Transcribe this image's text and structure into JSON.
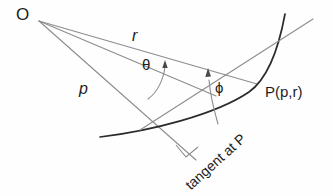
{
  "figure": {
    "type": "geometry-diagram",
    "background_color": "#fefefe",
    "stroke_color_light": "#8d8d8d",
    "stroke_color_dark": "#2b2b2b",
    "text_color": "#1d1d1d",
    "labels": {
      "origin": "O",
      "radius": "r",
      "theta": "θ",
      "pedal": "p",
      "phi": "ϕ",
      "point": "P(p,r)",
      "tangent": "tangent at P"
    },
    "elements": [
      {
        "name": "origin-point",
        "label": "O",
        "x": 38,
        "y": 20
      },
      {
        "name": "point-p",
        "label": "P(p,r)",
        "x": 256,
        "y": 84
      },
      {
        "name": "radius-line",
        "label": "r",
        "from": "O",
        "to": "P"
      },
      {
        "name": "pedal-line",
        "label": "p",
        "from": "O",
        "to": "foot of perpendicular"
      },
      {
        "name": "polar-axis-line",
        "from": "O",
        "to": "reference direction"
      },
      {
        "name": "curve",
        "label": "curve through P"
      },
      {
        "name": "tangent-line",
        "label": "tangent at P"
      },
      {
        "name": "angle-theta-arc",
        "label": "θ"
      },
      {
        "name": "angle-phi-arc",
        "label": "ϕ"
      },
      {
        "name": "right-angle-mark",
        "x": 186,
        "y": 147
      }
    ]
  }
}
